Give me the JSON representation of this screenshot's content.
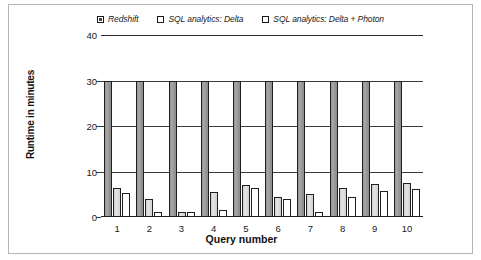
{
  "chart_data": {
    "type": "bar",
    "title": "",
    "xlabel": "Query number",
    "ylabel": "Runtime in minutes",
    "categories": [
      "1",
      "2",
      "3",
      "4",
      "5",
      "6",
      "7",
      "8",
      "9",
      "10"
    ],
    "ylim": [
      0,
      40
    ],
    "yticks": [
      "0",
      "10",
      "20",
      "30",
      "40"
    ],
    "ytick_values": [
      0,
      10,
      20,
      30,
      40
    ],
    "grid": "horizontal",
    "legend_position": "top-center",
    "note_capped": "Redshift bars are clipped at 30 minutes",
    "series": [
      {
        "name": "Redshift",
        "swatch": "filled-dark-square",
        "color": "#9c9c9c",
        "values": [
          30,
          30,
          30,
          30,
          30,
          30,
          30,
          30,
          30,
          30
        ]
      },
      {
        "name": "SQL analytics: Delta",
        "swatch": "light-gray-square",
        "color": "#d9d9d9",
        "values": [
          6.4,
          4.0,
          1.0,
          5.5,
          7.0,
          4.5,
          5.0,
          6.3,
          7.3,
          7.5
        ]
      },
      {
        "name": "SQL analytics: Delta + Photon",
        "swatch": "white-square",
        "color": "#ffffff",
        "values": [
          5.3,
          1.0,
          1.0,
          1.5,
          6.4,
          4.0,
          1.2,
          4.5,
          5.8,
          6.2
        ]
      }
    ]
  },
  "legend": {
    "entries": [
      {
        "label": "Redshift"
      },
      {
        "label": "SQL analytics: Delta"
      },
      {
        "label": "SQL analytics: Delta + Photon"
      }
    ]
  },
  "axes": {
    "y_axis_title": "Runtime in minutes",
    "x_axis_title": "Query number"
  }
}
